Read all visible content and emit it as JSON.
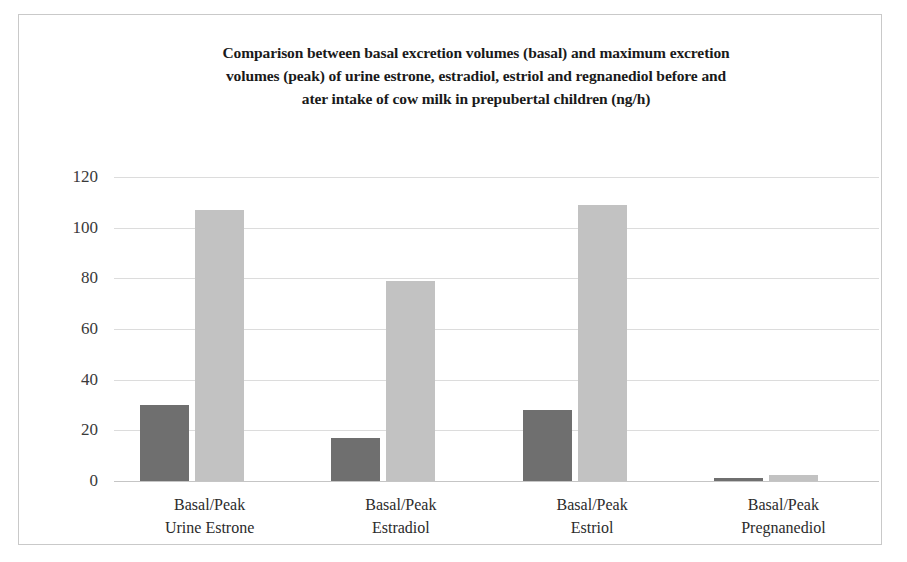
{
  "chart_data": {
    "type": "bar",
    "title_lines": [
      "Comparison between basal excretion volumes (basal) and maximum excretion",
      "volumes (peak) of urine estrone, estradiol, estriol and regnanediol before and",
      "ater intake of cow milk in prepubertal children (ng/h)"
    ],
    "xlabel": "",
    "ylabel": "",
    "ylim": [
      0,
      120
    ],
    "yticks": [
      0,
      20,
      40,
      60,
      80,
      100,
      120
    ],
    "ytick_labels": [
      "0",
      "20",
      "40",
      "60",
      "80",
      "100",
      "120"
    ],
    "grid": true,
    "legend": false,
    "legend_position": "none",
    "categories": [
      "Basal/Peak Urine Estrone",
      "Basal/Peak Estradiol",
      "Basal/Peak Estriol",
      "Basal/Peak Pregnanediol"
    ],
    "category_lines": [
      [
        "Basal/Peak",
        "Urine Estrone"
      ],
      [
        "Basal/Peak",
        "Estradiol"
      ],
      [
        "Basal/Peak",
        "Estriol"
      ],
      [
        "Basal/Peak",
        "Pregnanediol"
      ]
    ],
    "series": [
      {
        "name": "Basal",
        "color": "#6f6f6f",
        "values": [
          30,
          17,
          28,
          1
        ]
      },
      {
        "name": "Peak",
        "color": "#c2c2c2",
        "values": [
          107,
          79,
          109,
          2.5
        ]
      }
    ]
  },
  "style": {
    "background": "#ffffff",
    "frame_color": "#c9c9c9",
    "grid_color": "#dcdcdc",
    "axis_color": "#c5c5c5",
    "title_color": "#1a1a1a",
    "tick_color": "#3a3a3a",
    "label_color": "#2b2b2b"
  }
}
